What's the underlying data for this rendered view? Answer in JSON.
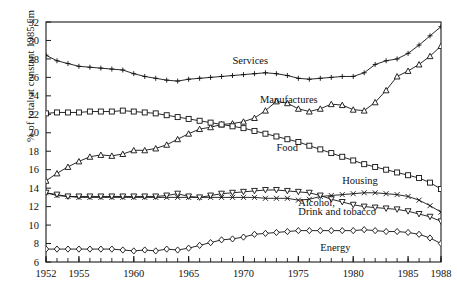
{
  "chart_data": {
    "type": "line",
    "title": "",
    "xlabel": "",
    "ylabel": "% of total at constant 1985 £m",
    "xlim": [
      1952,
      1988
    ],
    "ylim": [
      6,
      32
    ],
    "ytick_step": 2,
    "yticks": [
      6,
      8,
      10,
      12,
      14,
      16,
      18,
      20,
      22,
      24,
      26,
      28,
      30,
      32
    ],
    "xticks": [
      1952,
      1955,
      1960,
      1965,
      1970,
      1975,
      1980,
      1985,
      1988
    ],
    "xtick_labels": [
      "1952",
      "1955",
      "1960",
      "1965",
      "1970",
      "1975",
      "1980",
      "1985",
      "1988"
    ],
    "ytick_labels": [
      "6",
      "8",
      "10",
      "12",
      "14",
      "16",
      "18",
      "20",
      "22",
      "24",
      "26",
      "28",
      "30",
      "32"
    ],
    "minor_xticks_every": 1,
    "grid": false,
    "legend_position": "inline-annotations",
    "x": [
      1952,
      1953,
      1954,
      1955,
      1956,
      1957,
      1958,
      1959,
      1960,
      1961,
      1962,
      1963,
      1964,
      1965,
      1966,
      1967,
      1968,
      1969,
      1970,
      1971,
      1972,
      1973,
      1974,
      1975,
      1976,
      1977,
      1978,
      1979,
      1980,
      1981,
      1982,
      1983,
      1984,
      1985,
      1986,
      1987,
      1988
    ],
    "series": [
      {
        "name": "Services",
        "marker": "plus",
        "label": "Services",
        "label_x": 1969.0,
        "label_y": 27.4,
        "values": [
          28.4,
          27.8,
          27.5,
          27.2,
          27.1,
          27.0,
          26.9,
          26.8,
          26.4,
          26.1,
          25.9,
          25.7,
          25.6,
          25.8,
          25.9,
          26.0,
          26.1,
          26.2,
          26.3,
          26.4,
          26.5,
          26.4,
          26.2,
          25.9,
          25.8,
          25.9,
          26.0,
          26.1,
          26.1,
          26.5,
          27.4,
          27.8,
          28.0,
          28.6,
          29.5,
          30.5,
          31.5
        ]
      },
      {
        "name": "Manufactures",
        "marker": "triangle-up",
        "label": "Manufactures",
        "label_x": 1971.5,
        "label_y": 23.2,
        "values": [
          14.8,
          15.6,
          16.3,
          16.9,
          17.4,
          17.6,
          17.5,
          17.7,
          18.1,
          18.1,
          18.3,
          18.7,
          19.3,
          19.9,
          20.4,
          20.6,
          20.9,
          21.0,
          21.2,
          21.6,
          22.4,
          23.4,
          23.2,
          22.6,
          22.3,
          22.6,
          23.1,
          23.0,
          22.5,
          22.4,
          23.3,
          24.6,
          26.1,
          26.7,
          27.4,
          28.3,
          29.4
        ]
      },
      {
        "name": "Food",
        "marker": "square",
        "label": "Food",
        "label_x": 1973.0,
        "label_y": 18.0,
        "values": [
          22.1,
          22.2,
          22.2,
          22.2,
          22.3,
          22.3,
          22.3,
          22.4,
          22.3,
          22.2,
          22.1,
          21.9,
          21.7,
          21.5,
          21.3,
          21.1,
          20.9,
          20.7,
          20.5,
          20.2,
          19.9,
          19.6,
          19.3,
          19.0,
          18.6,
          18.2,
          17.8,
          17.4,
          17.0,
          16.6,
          16.3,
          16.0,
          15.7,
          15.4,
          15.1,
          14.6,
          13.9
        ]
      },
      {
        "name": "Housing",
        "marker": "x",
        "label": "Housing",
        "label_x": 1979.0,
        "label_y": 14.4,
        "values": [
          13.5,
          13.2,
          13.1,
          13.0,
          13.0,
          13.0,
          13.0,
          13.0,
          13.0,
          13.0,
          13.0,
          13.0,
          13.0,
          13.0,
          13.0,
          13.0,
          13.0,
          13.0,
          13.0,
          13.0,
          12.9,
          12.9,
          12.9,
          12.7,
          12.8,
          13.1,
          13.2,
          13.3,
          13.4,
          13.5,
          13.5,
          13.4,
          13.3,
          13.1,
          12.7,
          12.1,
          11.4
        ]
      },
      {
        "name": "Alcohol, Drink and tobacco",
        "marker": "triangle-down",
        "label": "Alcohol,",
        "label2": "Drink and tobacco",
        "label_x": 1975.0,
        "label_y": 12.1,
        "label2_y": 11.1,
        "values": [
          13.5,
          13.3,
          13.1,
          13.1,
          13.1,
          13.1,
          13.1,
          13.1,
          13.1,
          13.1,
          13.1,
          13.2,
          13.4,
          13.1,
          13.0,
          13.2,
          13.4,
          13.5,
          13.6,
          13.7,
          13.8,
          13.8,
          13.7,
          13.6,
          13.5,
          13.2,
          12.8,
          12.5,
          12.2,
          12.0,
          11.9,
          11.8,
          11.7,
          11.5,
          11.2,
          10.9,
          10.4
        ]
      },
      {
        "name": "Energy",
        "marker": "diamond",
        "label": "Energy",
        "label_x": 1977.0,
        "label_y": 7.2,
        "values": [
          7.4,
          7.4,
          7.4,
          7.4,
          7.4,
          7.4,
          7.4,
          7.3,
          7.2,
          7.3,
          7.2,
          7.4,
          7.3,
          7.5,
          7.8,
          8.1,
          8.4,
          8.5,
          8.7,
          9.0,
          9.1,
          9.2,
          9.3,
          9.4,
          9.4,
          9.4,
          9.4,
          9.4,
          9.4,
          9.5,
          9.4,
          9.3,
          9.3,
          9.2,
          9.0,
          8.6,
          8.0
        ]
      }
    ]
  }
}
